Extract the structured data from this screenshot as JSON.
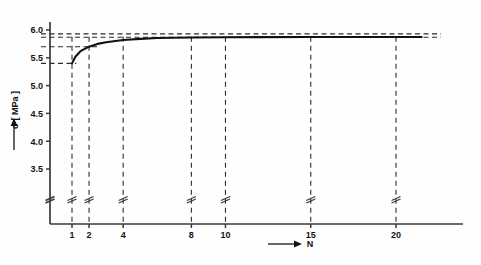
{
  "chart_data": {
    "type": "line",
    "title": "",
    "subtitle": "",
    "xlabel": "N",
    "ylabel": "σ [ MPa ]",
    "ylabel_unit": "MPa",
    "ylabel_symbol": "σ",
    "x_tick_labels": [
      "1",
      "2",
      "4",
      "8",
      "10",
      "15",
      "20"
    ],
    "x_tick_values": [
      1,
      2,
      4,
      8,
      10,
      15,
      20
    ],
    "y_tick_labels": [
      "3.5",
      "4.0",
      "4.5",
      "5.0",
      "5.5",
      "6.0"
    ],
    "y_tick_values": [
      3.5,
      4.0,
      4.5,
      5.0,
      5.5,
      6.0
    ],
    "xlim": [
      0,
      22
    ],
    "ylim": [
      3.2,
      6.15
    ],
    "grid": false,
    "legend": null,
    "axis_break_y": true,
    "axis_break_note": "//",
    "series": [
      {
        "name": "sigma vs N",
        "style": "solid",
        "x": [
          1,
          1.2,
          1.5,
          2,
          2.5,
          3,
          4,
          5,
          6,
          8,
          10,
          12,
          15,
          18,
          20,
          21.5
        ],
        "values": [
          5.4,
          5.52,
          5.62,
          5.7,
          5.75,
          5.78,
          5.82,
          5.84,
          5.855,
          5.865,
          5.87,
          5.872,
          5.874,
          5.875,
          5.875,
          5.875
        ]
      }
    ],
    "reference_lines_horizontal": [
      {
        "value": 5.93,
        "style": "dashed",
        "x_from": 0,
        "x_to": 22
      },
      {
        "value": 5.87,
        "style": "dashed",
        "x_from": 0,
        "x_to": 22
      },
      {
        "value": 5.7,
        "style": "dashed",
        "x_from": 0,
        "x_to": 2.6
      },
      {
        "value": 5.4,
        "style": "dashed",
        "x_from": 0,
        "x_to": 1.25
      }
    ],
    "reference_lines_vertical": [
      {
        "value": 1,
        "style": "dashed"
      },
      {
        "value": 2,
        "style": "dashed"
      },
      {
        "value": 4,
        "style": "dashed"
      },
      {
        "value": 8,
        "style": "dashed"
      },
      {
        "value": 10,
        "style": "dashed"
      },
      {
        "value": 15,
        "style": "dashed"
      },
      {
        "value": 20,
        "style": "dashed"
      }
    ],
    "colors": {
      "curve": "#111111",
      "axis": "#3a3a3a",
      "dashed": "#2b2b2b",
      "text": "#141414",
      "background": "#fefefe"
    }
  }
}
